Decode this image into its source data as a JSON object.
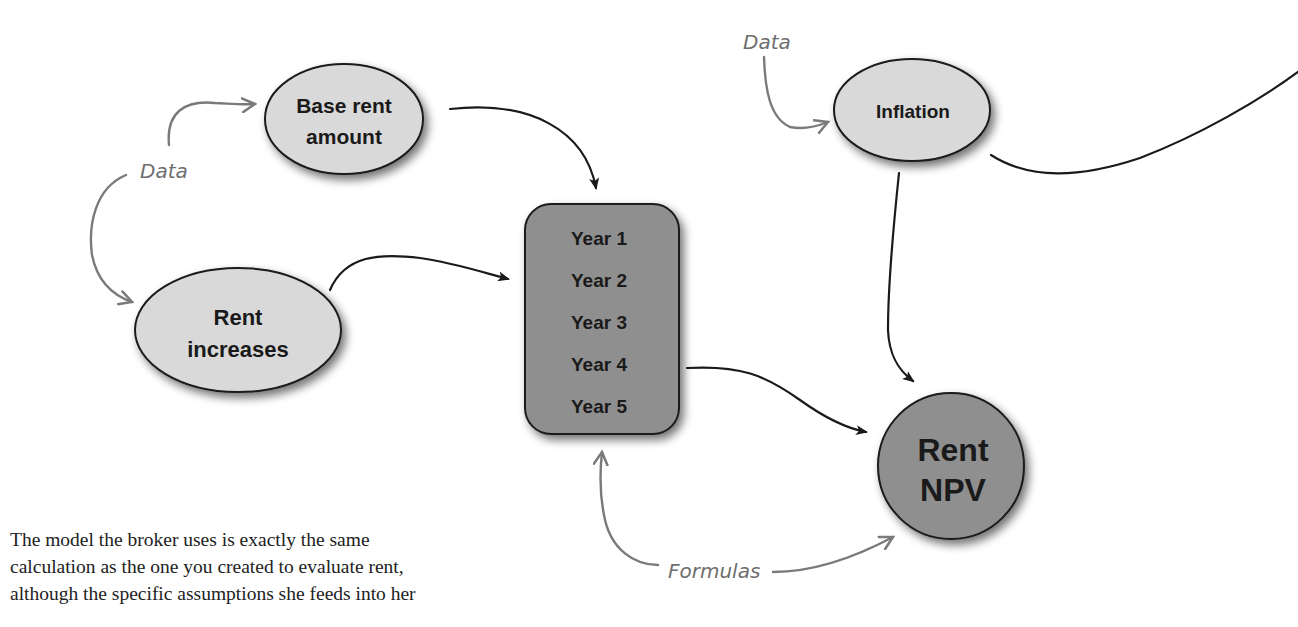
{
  "diagram": {
    "nodes": {
      "base_rent": {
        "line1": "Base rent",
        "line2": "amount"
      },
      "rent_increases": {
        "line1": "Rent",
        "line2": "increases"
      },
      "years": [
        "Year 1",
        "Year 2",
        "Year 3",
        "Year 4",
        "Year 5"
      ],
      "inflation": {
        "label": "Inflation"
      },
      "rent_npv": {
        "line1": "Rent",
        "line2": "NPV"
      }
    },
    "annotations": {
      "data_left": "Data",
      "data_top": "Data",
      "formulas": "Formulas"
    },
    "colors": {
      "light_node": "#d9d9d9",
      "dark_node": "#8f8f8f",
      "arrow_black": "#1a1a1a",
      "arrow_gray": "#7a7a7a"
    }
  },
  "caption": {
    "lines": [
      "The model the broker uses is exactly the same",
      "calculation as the one you created to evaluate rent,",
      "although the specific assumptions she feeds into her"
    ]
  }
}
